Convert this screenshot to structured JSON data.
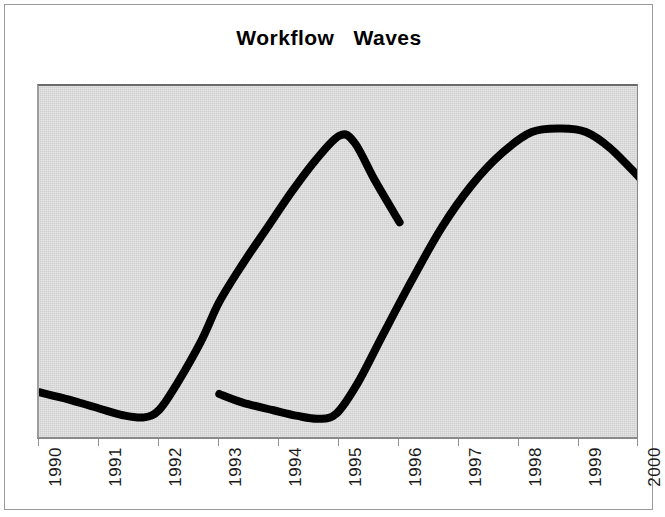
{
  "figure": {
    "title": "Workflow   Waves",
    "background_color": "#ffffff",
    "plot_background_color": "#cfcfcf",
    "frame_color": "#9a9a9a",
    "line_color": "#000000"
  },
  "chart_data": {
    "type": "line",
    "title": "Workflow   Waves",
    "xlabel": "",
    "ylabel": "",
    "grid": false,
    "legend": null,
    "xlim": [
      1990,
      2000
    ],
    "ylim": [
      0,
      100
    ],
    "x_tick_labels": [
      "1990",
      "1991",
      "1992",
      "1993",
      "1994",
      "1995",
      "1996",
      "1997",
      "1998",
      "1999",
      "2000"
    ],
    "y_tick_labels": [],
    "series": [
      {
        "name": "wave-1",
        "x": [
          1990.0,
          1990.5,
          1991.0,
          1991.4,
          1991.75,
          1992.0,
          1992.3,
          1992.7,
          1993.0,
          1993.4,
          1993.8,
          1994.2,
          1994.6,
          1995.0,
          1995.25,
          1995.6,
          1996.0
        ],
        "y": [
          13.5,
          11.4,
          8.9,
          7.0,
          6.4,
          8.5,
          16.0,
          28.0,
          39.0,
          50.0,
          60.0,
          70.0,
          79.0,
          86.0,
          84.0,
          73.0,
          61.5
        ]
      },
      {
        "name": "wave-2",
        "x": [
          1993.0,
          1993.4,
          1993.9,
          1994.3,
          1994.65,
          1994.95,
          1995.3,
          1995.7,
          1996.2,
          1996.7,
          1997.2,
          1997.7,
          1998.2,
          1998.7,
          1999.1,
          1999.5,
          2000.0
        ],
        "y": [
          13.0,
          10.5,
          8.4,
          6.8,
          6.0,
          7.5,
          16.0,
          29.0,
          45.0,
          60.0,
          72.0,
          81.0,
          87.0,
          88.0,
          87.0,
          82.5,
          74.0
        ]
      }
    ]
  },
  "axis": {
    "tick_positions_px": [
      38,
      98,
      158,
      218,
      278,
      338,
      398,
      458,
      518,
      578,
      637
    ]
  }
}
